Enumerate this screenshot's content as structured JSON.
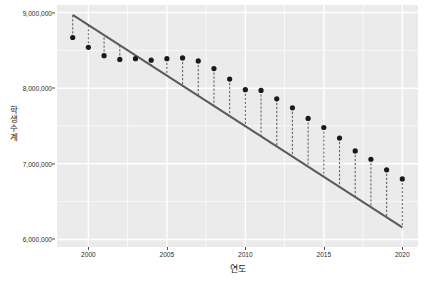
{
  "chart_data": {
    "type": "scatter",
    "title": "",
    "xlabel": "연도",
    "ylabel": "학생수계",
    "xlim": [
      1998.0,
      2021.0
    ],
    "ylim": [
      5900000,
      9100000
    ],
    "grid": true,
    "legend": null,
    "x_ticks": [
      2000,
      2005,
      2010,
      2015,
      2020
    ],
    "x_tick_labels": [
      "2000",
      "2005",
      "2010",
      "2015",
      "2020"
    ],
    "y_ticks": [
      6000000,
      7000000,
      8000000,
      9000000
    ],
    "y_tick_labels": [
      "6,000,000",
      "7,000,000",
      "8,000,000",
      "9,000,000"
    ],
    "x": [
      1999,
      2000,
      2001,
      2002,
      2003,
      2004,
      2005,
      2006,
      2007,
      2008,
      2009,
      2010,
      2011,
      2012,
      2013,
      2014,
      2015,
      2016,
      2017,
      2018,
      2019,
      2020
    ],
    "values": [
      8670000,
      8540000,
      8430000,
      8380000,
      8390000,
      8370000,
      8390000,
      8400000,
      8360000,
      8260000,
      8120000,
      7980000,
      7970000,
      7860000,
      7740000,
      7600000,
      7480000,
      7340000,
      7170000,
      7060000,
      6920000,
      6800000
    ],
    "series": [
      {
        "name": "학생수계",
        "marker": "filled-circle",
        "color": "#1a1a1a",
        "values": [
          8670000,
          8540000,
          8430000,
          8380000,
          8390000,
          8370000,
          8390000,
          8400000,
          8360000,
          8260000,
          8120000,
          7980000,
          7970000,
          7860000,
          7740000,
          7600000,
          7480000,
          7340000,
          7170000,
          7060000,
          6920000,
          6800000
        ]
      }
    ],
    "fit_line": {
      "name": "regression-line",
      "type": "linear",
      "color": "#5a5a5a",
      "x_start": 1999,
      "y_start": 8970000,
      "x_end": 2020,
      "y_end": 6160000
    },
    "residual_segments": {
      "name": "residual-dashed-lines",
      "style": "dashed",
      "color": "#666666"
    },
    "panel_background": "#ebebeb",
    "gridline_color": "#ffffff"
  },
  "axes": {
    "y_title": "학생수계",
    "x_title": "연도"
  }
}
